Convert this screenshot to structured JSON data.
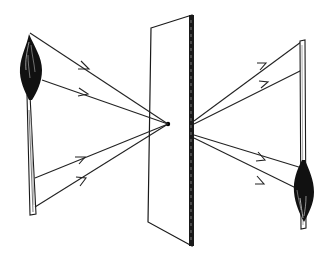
{
  "diagram": {
    "title": "Pinhole camera: upright candle projected inverted through a pinhole",
    "colors": {
      "ink": "#1a1a1a",
      "background": "#ffffff"
    },
    "objects": [
      {
        "id": "candle-object",
        "label": "Candle (upright object)"
      },
      {
        "id": "pinhole-screen",
        "label": "Opaque screen with pinhole"
      },
      {
        "id": "projection-screen",
        "label": "Projection screen"
      },
      {
        "id": "candle-image",
        "label": "Inverted candle image"
      }
    ],
    "rays": [
      {
        "from": [
          30,
          33
        ],
        "to": [
          168,
          124
        ],
        "continues_to": [
          300,
          190
        ]
      },
      {
        "from": [
          42,
          80
        ],
        "to": [
          168,
          124
        ],
        "continues_to": [
          302,
          168
        ]
      },
      {
        "from": [
          35,
          178
        ],
        "to": [
          168,
          124
        ],
        "continues_to": [
          302,
          70
        ]
      },
      {
        "from": [
          35,
          207
        ],
        "to": [
          168,
          124
        ],
        "continues_to": [
          301,
          42
        ]
      }
    ]
  }
}
